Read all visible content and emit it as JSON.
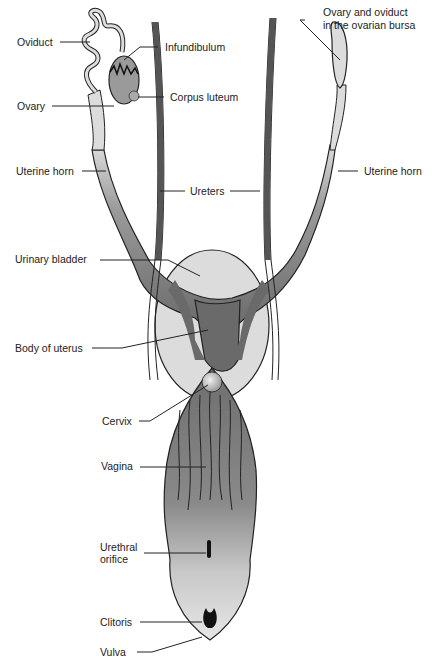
{
  "diagram": {
    "type": "anatomical illustration",
    "colors": {
      "organ_dark": "#6a6a6a",
      "organ_mid": "#9a9a9a",
      "organ_light": "#d8d8d8",
      "bladder": "#dcdcdc",
      "outline": "#222222",
      "background": "#ffffff"
    },
    "labels": {
      "oviduct": "Oviduct",
      "infundibulum": "Infundibulum",
      "ovary": "Ovary",
      "corpus_luteum": "Corpus luteum",
      "ovary_bursa_line1": "Ovary and oviduct",
      "ovary_bursa_line2": "in the ovarian bursa",
      "uterine_horn_left": "Uterine horn",
      "uterine_horn_right": "Uterine horn",
      "ureters": "Ureters",
      "urinary_bladder": "Urinary bladder",
      "body_of_uterus": "Body of uterus",
      "cervix": "Cervix",
      "vagina": "Vagina",
      "urethral_orifice_line1": "Urethral",
      "urethral_orifice_line2": "orifice",
      "clitoris": "Clitoris",
      "vulva": "Vulva"
    }
  }
}
